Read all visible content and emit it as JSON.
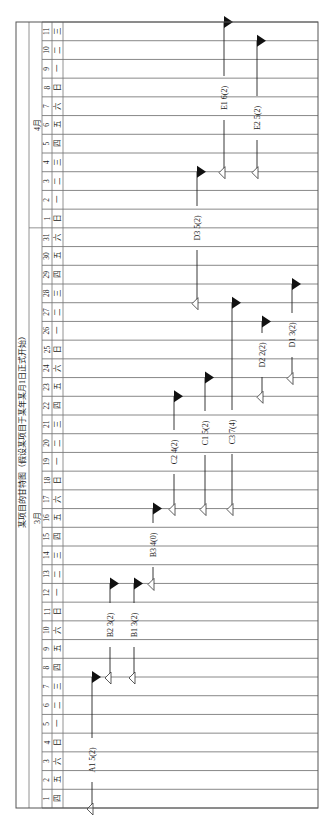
{
  "chart_data": {
    "type": "gantt",
    "orientation": "rotated-90-ccw",
    "title": "某项目的甘特图（假设某项目于某年某月1日正式开始）",
    "months": [
      {
        "label": "3月",
        "start_index": 0,
        "days": 31
      },
      {
        "label": "4月",
        "start_index": 31,
        "days": 11
      }
    ],
    "days": [
      {
        "d": "1",
        "w": "四"
      },
      {
        "d": "2",
        "w": "五"
      },
      {
        "d": "3",
        "w": "六"
      },
      {
        "d": "4",
        "w": "日"
      },
      {
        "d": "5",
        "w": "一"
      },
      {
        "d": "6",
        "w": "二"
      },
      {
        "d": "7",
        "w": "三"
      },
      {
        "d": "8",
        "w": "四"
      },
      {
        "d": "9",
        "w": "五"
      },
      {
        "d": "10",
        "w": "六"
      },
      {
        "d": "11",
        "w": "日"
      },
      {
        "d": "12",
        "w": "一"
      },
      {
        "d": "13",
        "w": "二"
      },
      {
        "d": "14",
        "w": "三"
      },
      {
        "d": "15",
        "w": "四"
      },
      {
        "d": "16",
        "w": "五"
      },
      {
        "d": "17",
        "w": "六"
      },
      {
        "d": "18",
        "w": "日"
      },
      {
        "d": "19",
        "w": "一"
      },
      {
        "d": "20",
        "w": "二"
      },
      {
        "d": "21",
        "w": "三"
      },
      {
        "d": "22",
        "w": "四"
      },
      {
        "d": "23",
        "w": "五"
      },
      {
        "d": "24",
        "w": "六"
      },
      {
        "d": "25",
        "w": "日"
      },
      {
        "d": "26",
        "w": "一"
      },
      {
        "d": "27",
        "w": "二"
      },
      {
        "d": "28",
        "w": "三"
      },
      {
        "d": "29",
        "w": "四"
      },
      {
        "d": "30",
        "w": "五"
      },
      {
        "d": "31",
        "w": "六"
      },
      {
        "d": "1",
        "w": "日"
      },
      {
        "d": "2",
        "w": "一"
      },
      {
        "d": "3",
        "w": "二"
      },
      {
        "d": "4",
        "w": "三"
      },
      {
        "d": "5",
        "w": "四"
      },
      {
        "d": "6",
        "w": "五"
      },
      {
        "d": "7",
        "w": "六"
      },
      {
        "d": "8",
        "w": "日"
      },
      {
        "d": "9",
        "w": "一"
      },
      {
        "d": "10",
        "w": "二"
      },
      {
        "d": "11",
        "w": "三"
      }
    ],
    "tasks": [
      {
        "label": "A1 5(2)",
        "name": "A1",
        "duration": 5,
        "slack": 2,
        "lane_x": 92,
        "start": "3/1",
        "end": "3/7",
        "start_day": 0,
        "end_day": 7,
        "label_y": 760
      },
      {
        "label": "B2 3(2)",
        "name": "B2",
        "duration": 3,
        "slack": 2,
        "lane_x": 110,
        "start": "3/8",
        "end": "3/12",
        "start_day": 7,
        "end_day": 12,
        "label_y": 625
      },
      {
        "label": "B1 3(2)",
        "name": "B1",
        "duration": 3,
        "slack": 2,
        "lane_x": 134,
        "start": "3/8",
        "end": "3/12",
        "start_day": 7,
        "end_day": 12,
        "label_y": 625
      },
      {
        "label": "B3 4(0)",
        "name": "B3",
        "duration": 4,
        "slack": 0,
        "lane_x": 153,
        "start": "3/13",
        "end": "3/16",
        "start_day": 12,
        "end_day": 16,
        "label_y": 545
      },
      {
        "label": "C2 4(2)",
        "name": "C2",
        "duration": 4,
        "slack": 2,
        "lane_x": 174,
        "start": "3/17",
        "end": "3/22",
        "start_day": 16,
        "end_day": 22,
        "label_y": 452
      },
      {
        "label": "C1 5(2)",
        "name": "C1",
        "duration": 5,
        "slack": 2,
        "lane_x": 205,
        "start": "3/17",
        "end": "3/23",
        "start_day": 16,
        "end_day": 23,
        "label_y": 433
      },
      {
        "label": "C3 7(4)",
        "name": "C3",
        "duration": 7,
        "slack": 4,
        "lane_x": 232,
        "start": "3/17",
        "end": "3/27",
        "start_day": 16,
        "end_day": 27,
        "label_y": 432
      },
      {
        "label": "D2 2(2)",
        "name": "D2",
        "duration": 2,
        "slack": 2,
        "lane_x": 262,
        "start": "3/23",
        "end": "3/26",
        "start_day": 22,
        "end_day": 26,
        "label_y": 355
      },
      {
        "label": "D1 3(2)",
        "name": "D1",
        "duration": 3,
        "slack": 2,
        "lane_x": 292,
        "start": "3/24",
        "end": "3/28",
        "start_day": 23,
        "end_day": 28,
        "label_y": 335
      },
      {
        "label": "D3 5(2)",
        "name": "D3",
        "duration": 5,
        "slack": 2,
        "lane_x": 197,
        "start": "3/28",
        "end": "4/3",
        "start_day": 27,
        "end_day": 34,
        "label_y": 228
      },
      {
        "label": "E1 6(2)",
        "name": "E1",
        "duration": 6,
        "slack": 2,
        "lane_x": 224,
        "start": "4/4",
        "end": "4/11",
        "start_day": 34,
        "end_day": 42,
        "label_y": 98
      },
      {
        "label": "E2 5(2)",
        "name": "E2",
        "duration": 5,
        "slack": 2,
        "lane_x": 257,
        "start": "4/4",
        "end": "4/10",
        "start_day": 34,
        "end_day": 41,
        "label_y": 118
      }
    ],
    "legend": {
      "filled_triangle": "task end",
      "hollow_triangle": "task start"
    },
    "grid": true
  }
}
